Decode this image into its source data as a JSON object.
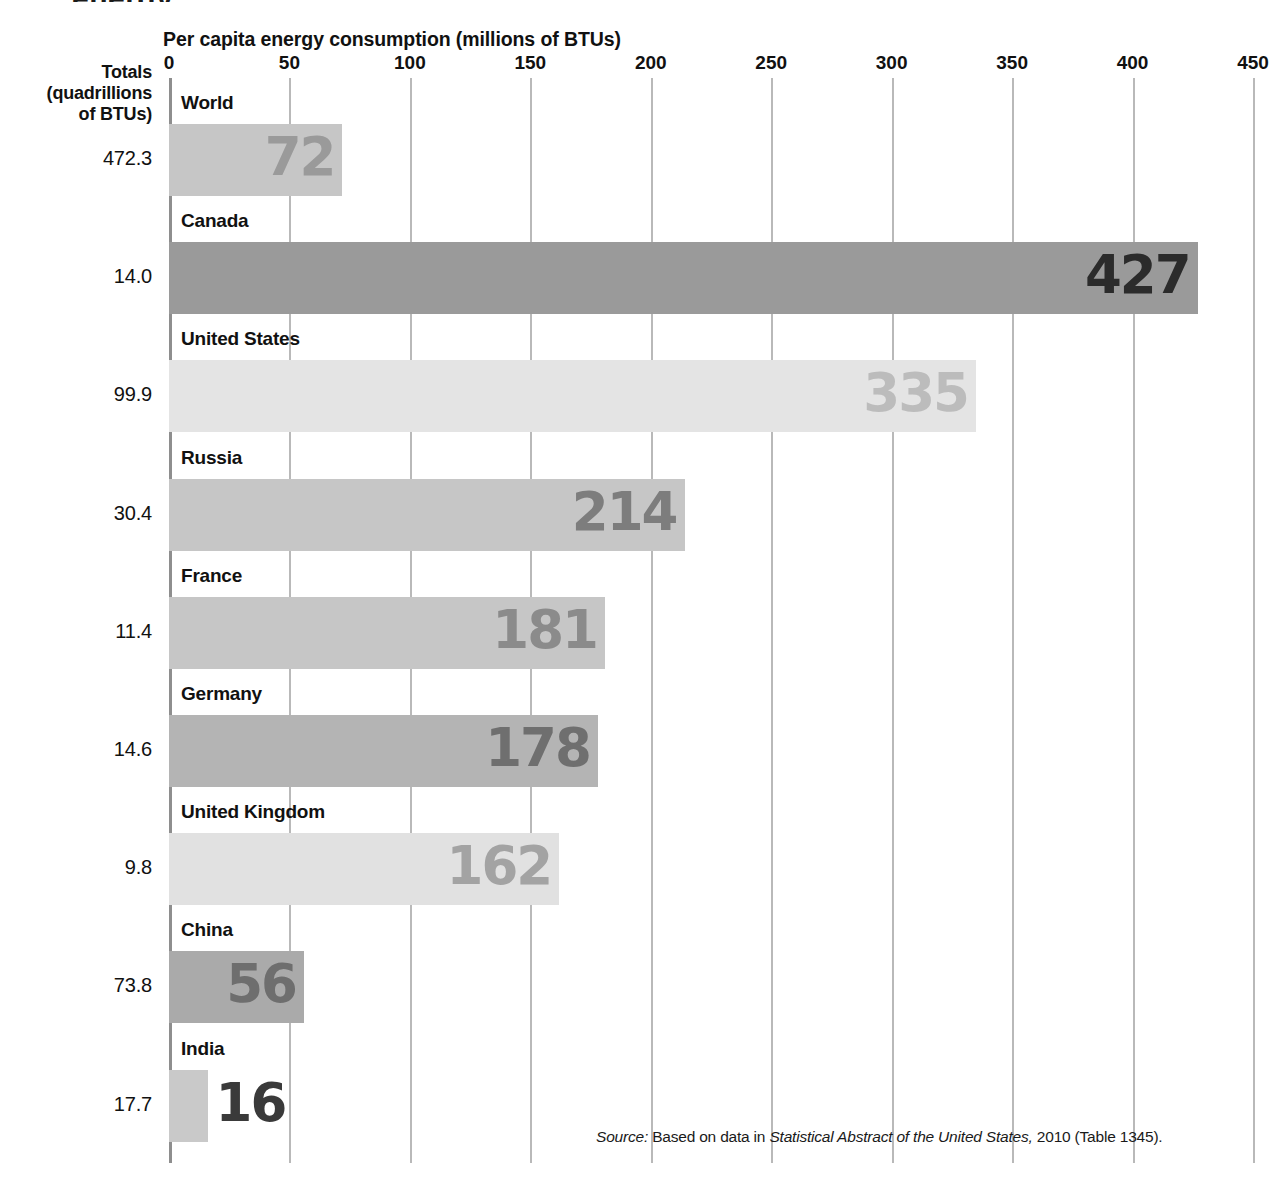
{
  "figure": {
    "cropped_top_text": "energy",
    "axis_title": "Per capita energy consumption (millions of BTUs)",
    "totals_header_line1": "Totals",
    "totals_header_line2": "(quadrillions",
    "totals_header_line3": "of BTUs)",
    "source_prefix": "Source:",
    "source_text_1": "Based on data in",
    "source_italic": "Statistical Abstract of the United States,",
    "source_text_2": "2010 (Table 1345)."
  },
  "chart_data": {
    "type": "bar",
    "orientation": "horizontal",
    "title": "Per capita energy consumption (millions of BTUs)",
    "xlabel": "Per capita energy consumption (millions of BTUs)",
    "ylabel": "",
    "xlim": [
      0,
      450
    ],
    "xticks": [
      0,
      50,
      100,
      150,
      200,
      250,
      300,
      350,
      400,
      450
    ],
    "tick_labels": [
      "0",
      "50",
      "100",
      "150",
      "200",
      "250",
      "300",
      "350",
      "400",
      "450"
    ],
    "grid": true,
    "legend": "none",
    "categories": [
      "World",
      "Canada",
      "United States",
      "Russia",
      "France",
      "Germany",
      "United Kingdom",
      "China",
      "India"
    ],
    "values": [
      72,
      427,
      335,
      214,
      181,
      178,
      162,
      56,
      16
    ],
    "value_labels": [
      "72",
      "427",
      "335",
      "214",
      "181",
      "178",
      "162",
      "56",
      "16"
    ],
    "secondary_series": {
      "name": "Totals (quadrillions of BTUs)",
      "values": [
        472.3,
        14.0,
        99.9,
        30.4,
        11.4,
        14.6,
        9.8,
        73.8,
        17.7
      ],
      "labels": [
        "472.3",
        "14.0",
        "99.9",
        "30.4",
        "11.4",
        "14.6",
        "9.8",
        "73.8",
        "17.7"
      ]
    },
    "bar_colors": [
      "#c6c6c6",
      "#9a9a9a",
      "#e4e4e4",
      "#c6c6c6",
      "#c6c6c6",
      "#b4b4b4",
      "#e1e1e1",
      "#aaaaaa",
      "#c9c9c9"
    ],
    "label_colors": [
      "#9a9a9a",
      "#2b2b2b",
      "#bcbcbc",
      "#7d7d7d",
      "#8b8b8b",
      "#6f6f6f",
      "#a3a3a3",
      "#6e6e6e",
      "#3a3a3a"
    ],
    "series": [
      {
        "name": "Per capita energy consumption",
        "values": [
          72,
          427,
          335,
          214,
          181,
          178,
          162,
          56,
          16
        ]
      }
    ],
    "rows": [
      {
        "category": "World",
        "value": 72,
        "value_label": "72",
        "total": "472.3",
        "bar_color": "#c6c6c6",
        "label_color": "#9a9a9a",
        "label_inside": true
      },
      {
        "category": "Canada",
        "value": 427,
        "value_label": "427",
        "total": "14.0",
        "bar_color": "#9a9a9a",
        "label_color": "#2b2b2b",
        "label_inside": true
      },
      {
        "category": "United States",
        "value": 335,
        "value_label": "335",
        "total": "99.9",
        "bar_color": "#e4e4e4",
        "label_color": "#bcbcbc",
        "label_inside": true
      },
      {
        "category": "Russia",
        "value": 214,
        "value_label": "214",
        "total": "30.4",
        "bar_color": "#c6c6c6",
        "label_color": "#7d7d7d",
        "label_inside": true
      },
      {
        "category": "France",
        "value": 181,
        "value_label": "181",
        "total": "11.4",
        "bar_color": "#c6c6c6",
        "label_color": "#8b8b8b",
        "label_inside": true
      },
      {
        "category": "Germany",
        "value": 178,
        "value_label": "178",
        "total": "14.6",
        "bar_color": "#b4b4b4",
        "label_color": "#6f6f6f",
        "label_inside": true
      },
      {
        "category": "United Kingdom",
        "value": 162,
        "value_label": "162",
        "total": "9.8",
        "bar_color": "#e1e1e1",
        "label_color": "#a3a3a3",
        "label_inside": true
      },
      {
        "category": "China",
        "value": 56,
        "value_label": "56",
        "total": "73.8",
        "bar_color": "#aaaaaa",
        "label_color": "#6e6e6e",
        "label_inside": true
      },
      {
        "category": "India",
        "value": 16,
        "value_label": "16",
        "total": "17.7",
        "bar_color": "#c9c9c9",
        "label_color": "#3a3a3a",
        "label_inside": false
      }
    ]
  }
}
